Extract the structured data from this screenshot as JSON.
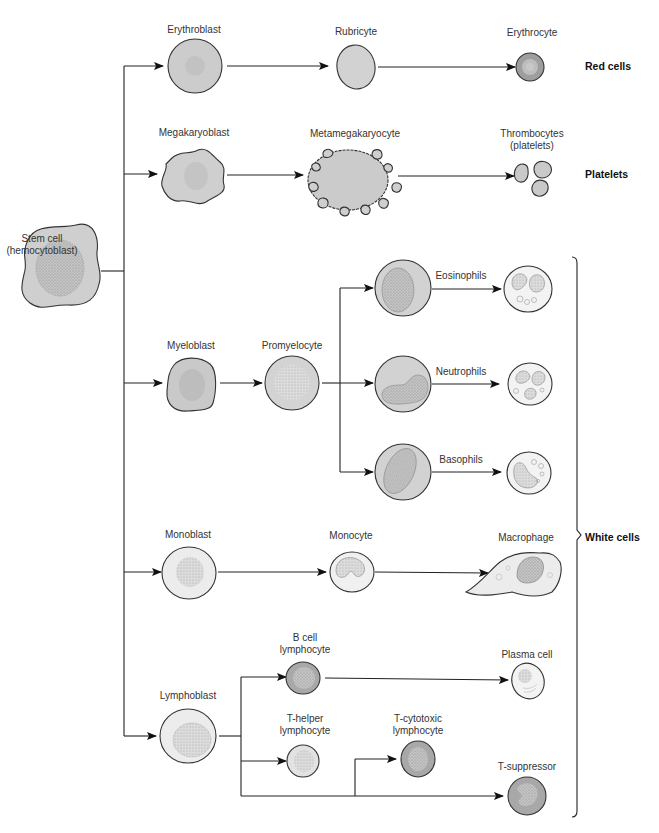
{
  "colors": {
    "cell_fill": "#cfcfcf",
    "cell_fill_light": "#ececec",
    "cell_fill_dark": "#a9a9a9",
    "nucleus_fill": "#bdbdbd",
    "outline": "#333333",
    "text": "#333333"
  },
  "groups": {
    "red": "Red cells",
    "platelets": "Platelets",
    "white": "White cells"
  },
  "cells": {
    "stem": {
      "line1": "Stem cell",
      "line2": "(hemocytoblast)"
    },
    "erythroblast": {
      "label": "Erythroblast"
    },
    "rubricyte": {
      "label": "Rubricyte"
    },
    "erythrocyte": {
      "label": "Erythrocyte"
    },
    "megakaryoblast": {
      "label": "Megakaryoblast"
    },
    "metamegakaryocyte": {
      "label": "Metamegakaryocyte"
    },
    "thrombocytes": {
      "line1": "Thrombocytes",
      "line2": "(platelets)"
    },
    "myeloblast": {
      "label": "Myeloblast"
    },
    "promyelocyte": {
      "label": "Promyelocyte"
    },
    "eosinophils": {
      "label": "Eosinophils"
    },
    "neutrophils": {
      "label": "Neutrophils"
    },
    "basophils": {
      "label": "Basophils"
    },
    "monoblast": {
      "label": "Monoblast"
    },
    "monocyte": {
      "label": "Monocyte"
    },
    "macrophage": {
      "label": "Macrophage"
    },
    "lymphoblast": {
      "label": "Lymphoblast"
    },
    "b_cell": {
      "line1": "B cell",
      "line2": "lymphocyte"
    },
    "plasma_cell": {
      "label": "Plasma cell"
    },
    "t_helper": {
      "line1": "T-helper",
      "line2": "lymphocyte"
    },
    "t_cytotoxic": {
      "line1": "T-cytotoxic",
      "line2": "lymphocyte"
    },
    "t_suppressor": {
      "label": "T-suppressor"
    }
  },
  "lineages": [
    {
      "group": "Red cells",
      "path": [
        "Stem cell",
        "Erythroblast",
        "Rubricyte",
        "Erythrocyte"
      ]
    },
    {
      "group": "Platelets",
      "path": [
        "Stem cell",
        "Megakaryoblast",
        "Metamegakaryocyte",
        "Thrombocytes (platelets)"
      ]
    },
    {
      "group": "White cells",
      "path": [
        "Stem cell",
        "Myeloblast",
        "Promyelocyte",
        "Eosinophils"
      ]
    },
    {
      "group": "White cells",
      "path": [
        "Stem cell",
        "Myeloblast",
        "Promyelocyte",
        "Neutrophils"
      ]
    },
    {
      "group": "White cells",
      "path": [
        "Stem cell",
        "Myeloblast",
        "Promyelocyte",
        "Basophils"
      ]
    },
    {
      "group": "White cells",
      "path": [
        "Stem cell",
        "Monoblast",
        "Monocyte",
        "Macrophage"
      ]
    },
    {
      "group": "White cells",
      "path": [
        "Stem cell",
        "Lymphoblast",
        "B cell lymphocyte",
        "Plasma cell"
      ]
    },
    {
      "group": "White cells",
      "path": [
        "Stem cell",
        "Lymphoblast",
        "T-helper lymphocyte"
      ]
    },
    {
      "group": "White cells",
      "path": [
        "Stem cell",
        "Lymphoblast",
        "T-cytotoxic lymphocyte"
      ]
    },
    {
      "group": "White cells",
      "path": [
        "Stem cell",
        "Lymphoblast",
        "T-suppressor"
      ]
    }
  ]
}
